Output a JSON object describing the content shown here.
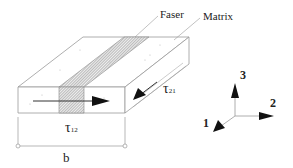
{
  "diagram": {
    "type": "composite-lamina-shear",
    "labels": {
      "fiber": "Faser",
      "matrix": "Matrix",
      "tau12_symbol": "τ",
      "tau12_sub": "12",
      "tau21_symbol": "τ",
      "tau21_sub": "21",
      "width": "b"
    },
    "axes": {
      "axis1": "1",
      "axis2": "2",
      "axis3": "3"
    },
    "colors": {
      "line": "#888888",
      "arrow": "#111111",
      "text": "#222222"
    }
  }
}
